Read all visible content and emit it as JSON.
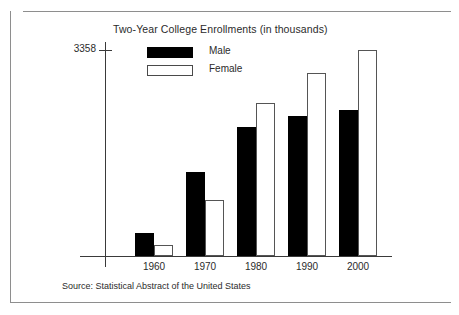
{
  "chart_data": {
    "type": "bar",
    "title": "Two-Year College Enrollments (in thousands)",
    "xlabel": "",
    "ylabel": "",
    "categories": [
      "1960",
      "1970",
      "1980",
      "1990",
      "2000"
    ],
    "series": [
      {
        "name": "Male",
        "color": "#000000",
        "values": [
          375,
          1370,
          2100,
          2280,
          2380
        ]
      },
      {
        "name": "Female",
        "color": "#ffffff",
        "values": [
          180,
          910,
          2490,
          2980,
          3358
        ]
      }
    ],
    "ylim": [
      0,
      3358
    ],
    "ytick_labels": [
      "3358"
    ],
    "ytick_values": [
      3358
    ],
    "grid": false,
    "legend_position": "top-left-inside",
    "annotations": {
      "source": "Source: Statistical Abstract of the United States"
    }
  },
  "axis": {
    "y_tick_label": "3358"
  },
  "legend": {
    "items": [
      {
        "label": "Male",
        "swatch": "filled-black-swatch"
      },
      {
        "label": "Female",
        "swatch": "outlined-white-swatch"
      }
    ]
  },
  "footer": {
    "source": "Source: Statistical Abstract of the United States"
  }
}
